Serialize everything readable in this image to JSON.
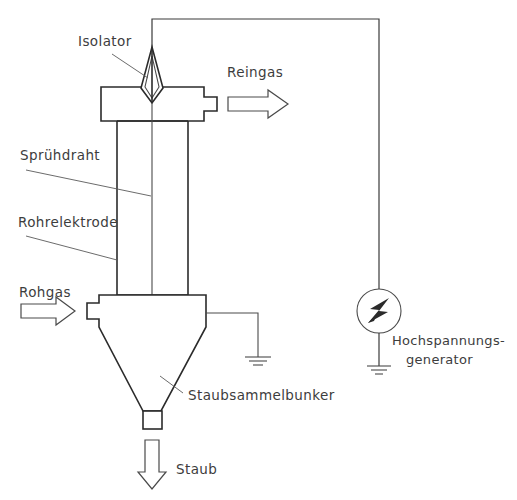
{
  "diagram": {
    "labels": {
      "isolator": "Isolator",
      "spruehdraht": "Sprühdraht",
      "rohrelektrode": "Rohrelektrode",
      "rohgas": "Rohgas",
      "reingas": "Reingas",
      "staubsammelbunker": "Staubsammelbunker",
      "staub": "Staub",
      "hochspannungsgenerator_line1": "Hochspannungs-",
      "hochspannungsgenerator_line2": "generator"
    },
    "icons": {
      "generator": "lightning-bolt-icon",
      "ground_hopper": "ground-symbol-icon",
      "ground_generator": "ground-symbol-icon",
      "inlet_arrow": "arrow-right-icon",
      "outlet_arrow": "arrow-right-icon",
      "dust_arrow": "arrow-down-icon",
      "isolator": "diamond-insulator-icon",
      "wire_weight": "wire-weight-circle-icon"
    },
    "colors": {
      "line": "#2b2b2b",
      "thin_line": "#4a4a4a",
      "leader": "#5a5a5a",
      "text": "#3d3d3d",
      "background": "#ffffff"
    }
  }
}
